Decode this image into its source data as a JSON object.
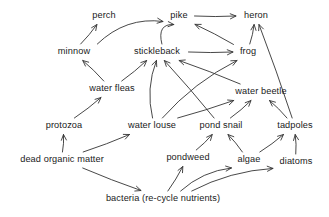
{
  "diagram": {
    "type": "food-web",
    "style": {
      "background": "#ffffff",
      "line_color": "#333333",
      "text_color": "#1a1a1a",
      "line_width": 0.9
    },
    "nodes": [
      {
        "id": "perch",
        "label": "perch",
        "x": 104,
        "y": 16,
        "w": 34,
        "h": 11
      },
      {
        "id": "pike",
        "label": "pike",
        "x": 179,
        "y": 16,
        "w": 26,
        "h": 11
      },
      {
        "id": "heron",
        "label": "heron",
        "x": 256,
        "y": 16,
        "w": 34,
        "h": 11
      },
      {
        "id": "minnow",
        "label": "minnow",
        "x": 74,
        "y": 52,
        "w": 43,
        "h": 11
      },
      {
        "id": "stickleback",
        "label": "stickleback",
        "x": 157,
        "y": 52,
        "w": 58,
        "h": 11
      },
      {
        "id": "frog",
        "label": "frog",
        "x": 248,
        "y": 52,
        "w": 24,
        "h": 11
      },
      {
        "id": "waterfleas",
        "label": "water fleas",
        "x": 112,
        "y": 89,
        "w": 55,
        "h": 11
      },
      {
        "id": "waterbeetle",
        "label": "water beetle",
        "x": 261,
        "y": 92,
        "w": 61,
        "h": 11
      },
      {
        "id": "protozoa",
        "label": "protozoa",
        "x": 64,
        "y": 126,
        "w": 44,
        "h": 11
      },
      {
        "id": "waterlouse",
        "label": "water louse",
        "x": 152,
        "y": 126,
        "w": 57,
        "h": 11
      },
      {
        "id": "pondsnail",
        "label": "pond snail",
        "x": 221,
        "y": 126,
        "w": 53,
        "h": 11
      },
      {
        "id": "tadpoles",
        "label": "tadpoles",
        "x": 295,
        "y": 126,
        "w": 44,
        "h": 11
      },
      {
        "id": "deadmatter",
        "label": "dead organic matter",
        "x": 62,
        "y": 160,
        "w": 100,
        "h": 11
      },
      {
        "id": "pondweed",
        "label": "pondweed",
        "x": 188,
        "y": 158,
        "w": 50,
        "h": 11
      },
      {
        "id": "algae",
        "label": "algae",
        "x": 249,
        "y": 160,
        "w": 29,
        "h": 11
      },
      {
        "id": "diatoms",
        "label": "diatoms",
        "x": 296,
        "y": 162,
        "w": 40,
        "h": 11
      },
      {
        "id": "bacteria",
        "label": "bacteria (re-cycle nutrients)",
        "x": 163,
        "y": 199,
        "w": 147,
        "h": 11
      }
    ],
    "links": [
      {
        "from": "minnow",
        "to": "perch",
        "kind": "straight"
      },
      {
        "from": "minnow",
        "to": "pike",
        "kind": "curve-up"
      },
      {
        "from": "stickleback",
        "to": "pike",
        "kind": "curve-up"
      },
      {
        "from": "pike",
        "to": "heron",
        "kind": "straight"
      },
      {
        "from": "frog",
        "to": "pike",
        "kind": "straight"
      },
      {
        "from": "frog",
        "to": "heron",
        "kind": "straight"
      },
      {
        "from": "tadpoles",
        "to": "heron",
        "kind": "straight"
      },
      {
        "from": "waterfleas",
        "to": "minnow",
        "kind": "straight"
      },
      {
        "from": "waterfleas",
        "to": "stickleback",
        "kind": "straight"
      },
      {
        "from": "waterlouse",
        "to": "stickleback",
        "kind": "curve"
      },
      {
        "from": "pondsnail",
        "to": "stickleback",
        "kind": "straight"
      },
      {
        "from": "waterbeetle",
        "to": "stickleback",
        "kind": "straight"
      },
      {
        "from": "waterlouse",
        "to": "frog",
        "kind": "curve"
      },
      {
        "from": "stickleback",
        "to": "frog",
        "kind": "straight"
      },
      {
        "from": "waterlouse",
        "to": "waterbeetle",
        "kind": "straight"
      },
      {
        "from": "pondsnail",
        "to": "waterbeetle",
        "kind": "straight"
      },
      {
        "from": "tadpoles",
        "to": "waterbeetle",
        "kind": "straight"
      },
      {
        "from": "protozoa",
        "to": "waterfleas",
        "kind": "straight"
      },
      {
        "from": "deadmatter",
        "to": "protozoa",
        "kind": "straight"
      },
      {
        "from": "deadmatter",
        "to": "waterlouse",
        "kind": "straight"
      },
      {
        "from": "deadmatter",
        "to": "bacteria",
        "kind": "straight"
      },
      {
        "from": "pondweed",
        "to": "pondsnail",
        "kind": "straight"
      },
      {
        "from": "algae",
        "to": "pondsnail",
        "kind": "straight"
      },
      {
        "from": "algae",
        "to": "tadpoles",
        "kind": "straight"
      },
      {
        "from": "diatoms",
        "to": "tadpoles",
        "kind": "straight"
      },
      {
        "from": "bacteria",
        "to": "pondweed",
        "kind": "straight"
      },
      {
        "from": "bacteria",
        "to": "algae",
        "kind": "curve"
      },
      {
        "from": "bacteria",
        "to": "diatoms",
        "kind": "curve"
      }
    ]
  }
}
